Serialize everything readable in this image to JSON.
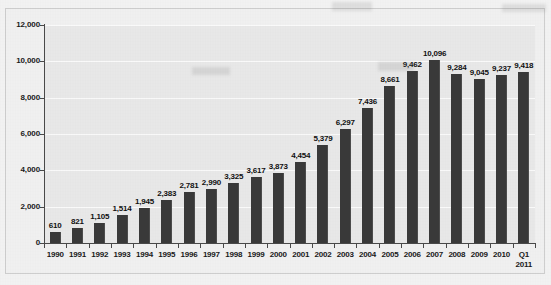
{
  "chart_data": {
    "type": "bar",
    "title": "",
    "subtitle": "",
    "xlabel": "",
    "ylabel": "",
    "categories": [
      "1990",
      "1991",
      "1992",
      "1993",
      "1994",
      "1995",
      "1996",
      "1997",
      "1998",
      "1999",
      "2000",
      "2001",
      "2002",
      "2003",
      "2004",
      "2005",
      "2006",
      "2007",
      "2008",
      "2009",
      "2010",
      "Q1\n2011"
    ],
    "values": [
      610,
      821,
      1105,
      1514,
      1945,
      2383,
      2781,
      2990,
      3325,
      3617,
      3873,
      4454,
      5379,
      6297,
      7436,
      8661,
      9462,
      10096,
      9284,
      9045,
      9237,
      9418
    ],
    "value_labels": [
      "610",
      "821",
      "1,105",
      "1,514",
      "1,945",
      "2,383",
      "2,781",
      "2,990",
      "3,325",
      "3,617",
      "3,873",
      "4,454",
      "5,379",
      "6,297",
      "7,436",
      "8,661",
      "9,462",
      "10,096",
      "9,284",
      "9,045",
      "9,237",
      "9,418"
    ],
    "ylim": [
      0,
      12000
    ],
    "ytick_values": [
      0,
      2000,
      4000,
      6000,
      8000,
      10000,
      12000
    ],
    "ytick_labels": [
      "0",
      "2,000",
      "4,000",
      "6,000",
      "8,000",
      "10,000",
      "12,000"
    ],
    "grid": true,
    "grid_axis": "y",
    "legend": null,
    "legend_position": "none",
    "series": [
      {
        "name": "",
        "values": [
          610,
          821,
          1105,
          1514,
          1945,
          2383,
          2781,
          2990,
          3325,
          3617,
          3873,
          4454,
          5379,
          6297,
          7436,
          8661,
          9462,
          10096,
          9284,
          9045,
          9237,
          9418
        ]
      }
    ],
    "annotations": [],
    "colors": {
      "bar": "#3a3a3a",
      "plot_background": "#e9e9e9",
      "frame_background": "#f1f1f1",
      "gridline": "#fbfbfb",
      "axis": "#4a4a4a",
      "text": "#111111"
    }
  }
}
